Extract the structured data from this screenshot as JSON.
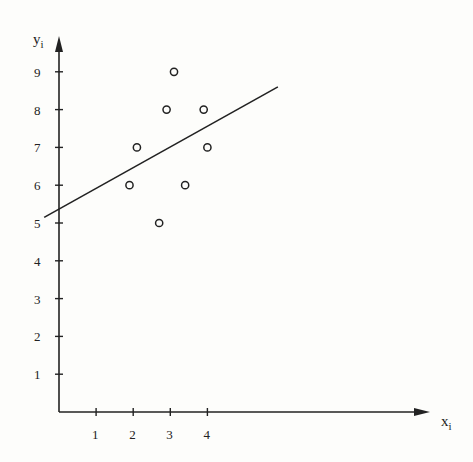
{
  "chart_data": {
    "type": "scatter",
    "title": "",
    "xlabel": "x",
    "xlabel_subscript": "i",
    "ylabel": "y",
    "ylabel_subscript": "i",
    "x_ticks": [
      1,
      2,
      3,
      4
    ],
    "y_ticks": [
      1,
      2,
      3,
      4,
      5,
      6,
      7,
      8,
      9
    ],
    "xlim": [
      0,
      9.7
    ],
    "ylim": [
      0,
      9.8
    ],
    "grid": false,
    "legend": null,
    "points": [
      {
        "x": 1.9,
        "y": 6
      },
      {
        "x": 2.1,
        "y": 7
      },
      {
        "x": 2.7,
        "y": 5
      },
      {
        "x": 2.9,
        "y": 8
      },
      {
        "x": 3.1,
        "y": 9
      },
      {
        "x": 3.4,
        "y": 6
      },
      {
        "x": 3.9,
        "y": 8
      },
      {
        "x": 4.0,
        "y": 7
      }
    ],
    "fit_line": {
      "x_start": -0.4,
      "y_start": 5.15,
      "x_end": 5.9,
      "y_end": 8.6,
      "intercept": 5.35,
      "slope": 0.55
    }
  },
  "colors": {
    "ink": "#222222",
    "background": "#fdfdfb"
  }
}
